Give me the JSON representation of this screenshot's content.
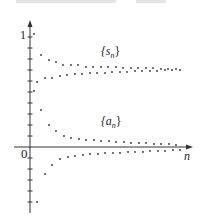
{
  "chart_data": {
    "type": "scatter",
    "title": "",
    "xlabel": "n",
    "ylabel": "",
    "y_tick_labels": [
      "0",
      "1"
    ],
    "ylim": [
      -0.55,
      1.05
    ],
    "grid": false,
    "legend": "inline labels",
    "series": [
      {
        "name": "{s_n}",
        "label_main": "{s",
        "label_sub": "n",
        "label_close": "}",
        "color": "#333333",
        "points_px": [
          [
            34,
            34
          ],
          [
            37,
            82
          ],
          [
            41,
            55
          ],
          [
            45,
            78
          ],
          [
            49,
            60
          ],
          [
            52,
            78
          ],
          [
            56,
            62
          ],
          [
            60,
            76
          ],
          [
            63,
            65
          ],
          [
            67,
            75
          ],
          [
            71,
            65
          ],
          [
            75,
            74
          ],
          [
            78,
            65
          ],
          [
            82,
            74
          ],
          [
            86,
            67
          ],
          [
            90,
            73
          ],
          [
            93,
            67
          ],
          [
            97,
            73
          ],
          [
            101,
            67
          ],
          [
            105,
            73
          ],
          [
            108,
            67
          ],
          [
            112,
            72
          ],
          [
            116,
            67
          ],
          [
            120,
            72
          ],
          [
            123,
            68
          ],
          [
            127,
            72
          ],
          [
            131,
            68
          ],
          [
            135,
            71
          ],
          [
            138,
            68
          ],
          [
            142,
            71
          ],
          [
            146,
            68
          ],
          [
            150,
            71
          ],
          [
            153,
            68
          ],
          [
            157,
            71
          ],
          [
            161,
            69
          ],
          [
            165,
            70
          ],
          [
            168,
            69
          ],
          [
            172,
            70
          ],
          [
            176,
            69
          ],
          [
            180,
            70
          ]
        ]
      },
      {
        "name": "{a_n}",
        "label_main": "{a",
        "label_sub": "n",
        "label_close": "}",
        "color": "#333333",
        "points_px": [
          [
            34,
            91
          ],
          [
            37,
            202
          ],
          [
            41,
            110
          ],
          [
            45,
            174
          ],
          [
            49,
            125
          ],
          [
            52,
            165
          ],
          [
            56,
            131
          ],
          [
            60,
            159
          ],
          [
            64,
            136
          ],
          [
            68,
            157
          ],
          [
            71,
            138
          ],
          [
            75,
            156
          ],
          [
            79,
            139
          ],
          [
            83,
            155
          ],
          [
            86,
            140
          ],
          [
            90,
            154
          ],
          [
            94,
            140
          ],
          [
            98,
            154
          ],
          [
            101,
            141
          ],
          [
            105,
            153
          ],
          [
            109,
            141
          ],
          [
            113,
            153
          ],
          [
            116,
            142
          ],
          [
            120,
            153
          ],
          [
            124,
            142
          ],
          [
            128,
            152
          ],
          [
            131,
            143
          ],
          [
            135,
            152
          ],
          [
            139,
            143
          ],
          [
            143,
            152
          ],
          [
            146,
            143
          ],
          [
            150,
            151
          ],
          [
            154,
            144
          ],
          [
            158,
            151
          ],
          [
            161,
            144
          ],
          [
            165,
            151
          ],
          [
            169,
            144
          ],
          [
            173,
            150
          ],
          [
            176,
            145
          ],
          [
            180,
            150
          ]
        ]
      }
    ],
    "axes_px": {
      "origin": [
        30,
        147
      ],
      "y_top": 20,
      "y_bottom": 213,
      "x_right": 193,
      "y_tick_spacing": 11
    }
  },
  "labels": {
    "one": "1",
    "zero": "0",
    "n": "n"
  }
}
